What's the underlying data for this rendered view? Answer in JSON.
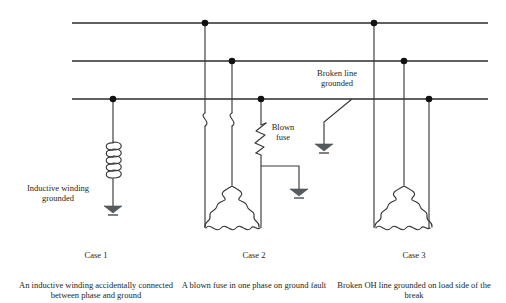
{
  "figure": {
    "kind": "electrical-schematic",
    "background_color": "#ffffff",
    "line_color": "#2b2b2b",
    "ground_symbol_color": "#555a5e"
  },
  "annotations": {
    "inductive_winding_grounded": "Inductive winding\ngrounded",
    "blown_fuse": "Blown\nfuse",
    "broken_line_grounded": "Broken line\ngrounded"
  },
  "cases": [
    {
      "id": "case-1",
      "title": "Case 1",
      "description": "An inductive winding accidentally connected between phase and ground"
    },
    {
      "id": "case-2",
      "title": "Case 2",
      "description": "A blown fuse in one phase on ground fault"
    },
    {
      "id": "case-3",
      "title": "Case 3",
      "description": "Broken OH line grounded on load side of the break"
    }
  ],
  "schematic": {
    "phase_lines": [
      {
        "name": "phase-line-top",
        "y": 23,
        "x1": 72,
        "x2": 488
      },
      {
        "name": "phase-line-middle",
        "y": 61,
        "x1": 72,
        "x2": 488
      },
      {
        "name": "phase-line-bottom",
        "y": 99,
        "x1": 72,
        "x2": 488
      }
    ],
    "junction_dots": [
      {
        "name": "node-case1-bottom",
        "x": 113,
        "y": 99
      },
      {
        "name": "node-case2-top",
        "x": 205,
        "y": 23
      },
      {
        "name": "node-case2-middle",
        "x": 232,
        "y": 61
      },
      {
        "name": "node-case2-bottom",
        "x": 261,
        "y": 99
      },
      {
        "name": "node-case3-top",
        "x": 374,
        "y": 23
      },
      {
        "name": "node-case3-middle",
        "x": 404,
        "y": 61
      },
      {
        "name": "node-case3-bottom",
        "x": 429,
        "y": 99
      }
    ],
    "elements": [
      "inductor-coil",
      "ground-symbol-case1",
      "break-jog-case2-a",
      "break-jog-case2-b",
      "blown-fuse-symbol",
      "ground-symbol-case2",
      "delta-winding-case2",
      "broken-line-drop",
      "ground-symbol-broken-line",
      "delta-winding-case3"
    ]
  }
}
